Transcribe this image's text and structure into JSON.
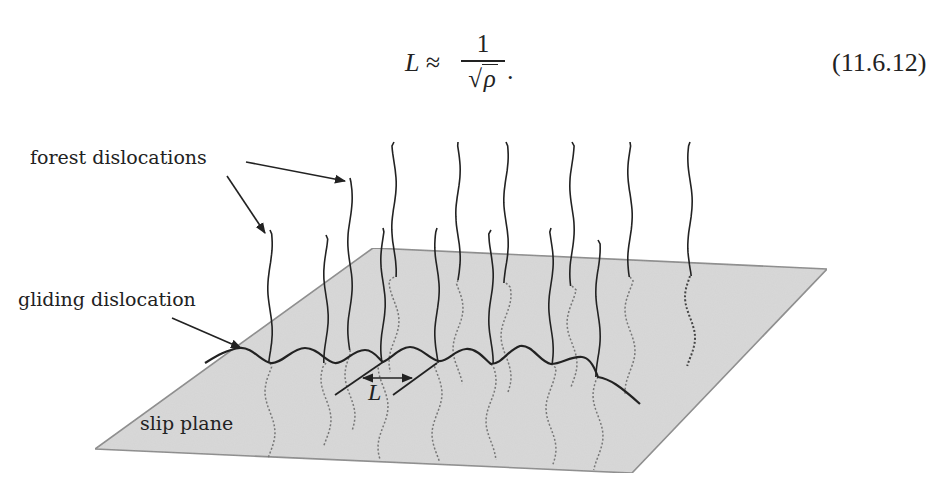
{
  "equation": {
    "lhs": "L ≈",
    "numerator": "1",
    "radical": "√",
    "denominator_symbol": "ρ",
    "trailing": ".",
    "number": "(11.6.12)"
  },
  "figure": {
    "labels": {
      "forest": "forest dislocations",
      "gliding": "gliding dislocation",
      "slip_plane": "slip plane",
      "spacing": "L"
    },
    "colors": {
      "plane_fill": "#d9d9d9",
      "plane_edge": "#8a8a8a",
      "line": "#222222",
      "dotted": "#777777"
    }
  }
}
